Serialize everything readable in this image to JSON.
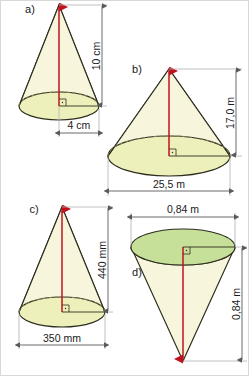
{
  "figure": {
    "background_color": "#ffffff",
    "colors": {
      "cone_body_fill": "#f7f6dc",
      "base_ellipse_fill": "#eef0bc",
      "top_ellipse_fill_d": "#c6e09a",
      "outline": "#2d2d1e",
      "axis_red": "#c1121f",
      "hidden_arc": "#8a8a5e",
      "dimension_line": "#5a5a5a",
      "extension_line": "#b0b0b0"
    },
    "panels": [
      {
        "id": "a",
        "label": "a)",
        "orientation": "upright",
        "height_label": "10 cm",
        "height_value": 10,
        "height_unit": "cm",
        "height_dim_position": "right-vertical",
        "base_label": "4 cm",
        "base_value": 4,
        "base_unit": "cm",
        "base_dim_meaning": "radius",
        "base_dim_position": "bottom-horizontal",
        "right_angle_marker": true
      },
      {
        "id": "b",
        "label": "b)",
        "orientation": "upright",
        "height_label": "17,0 m",
        "height_value": 17.0,
        "height_unit": "m",
        "height_dim_position": "right-vertical",
        "base_label": "25,5 m",
        "base_value": 25.5,
        "base_unit": "m",
        "base_dim_meaning": "diameter",
        "base_dim_position": "bottom-horizontal",
        "right_angle_marker": true
      },
      {
        "id": "c",
        "label": "c)",
        "orientation": "upright",
        "height_label": "440 mm",
        "height_value": 440,
        "height_unit": "mm",
        "height_dim_position": "right-vertical",
        "base_label": "350 mm",
        "base_value": 350,
        "base_unit": "mm",
        "base_dim_meaning": "diameter",
        "base_dim_position": "bottom-horizontal",
        "right_angle_marker": true
      },
      {
        "id": "d",
        "label": "d)",
        "orientation": "inverted",
        "height_label": "0,84 m",
        "height_value": 0.84,
        "height_unit": "m",
        "height_dim_position": "right-vertical",
        "base_label": "0,84 m",
        "base_value": 0.84,
        "base_unit": "m",
        "base_dim_meaning": "diameter",
        "base_dim_position": "top-horizontal",
        "right_angle_marker": true
      }
    ]
  }
}
